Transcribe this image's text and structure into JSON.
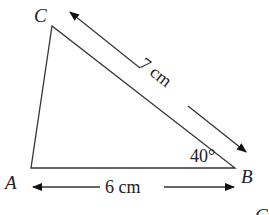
{
  "diagram": {
    "type": "triangle",
    "vertices": {
      "A": {
        "label": "A"
      },
      "B": {
        "label": "B"
      },
      "C": {
        "label": "C"
      }
    },
    "sides": {
      "AB": {
        "label": "6 cm",
        "value": 6,
        "unit": "cm"
      },
      "BC": {
        "label": "7 cm",
        "value": 7,
        "unit": "cm"
      }
    },
    "angles": {
      "B": {
        "label": "40°",
        "value": 40
      }
    },
    "corner_fragment": "C",
    "colors": {
      "line": "#333333",
      "text": "#222222",
      "background": "#ffffff"
    }
  }
}
